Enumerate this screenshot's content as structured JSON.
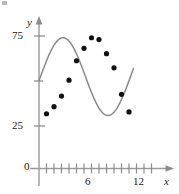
{
  "chart_data": {
    "type": "scatter",
    "title": "",
    "subtitle": "",
    "xlabel": "x",
    "ylabel": "y",
    "xlim": [
      0,
      13.2
    ],
    "ylim": [
      0,
      88
    ],
    "grid": false,
    "legend": null,
    "x_ticks_major": [
      6,
      12
    ],
    "x_tick_labels": [
      "6",
      "12"
    ],
    "x_ticks_minor": [
      1,
      2,
      3,
      4,
      5,
      7,
      8,
      9,
      10,
      11
    ],
    "y_ticks": [
      0,
      25,
      75
    ],
    "y_tick_labels": [
      "0",
      "25",
      "75"
    ],
    "point_color": "#111111",
    "curve_color": "#8a8a8a",
    "axis_color": "#9a9a9a",
    "scatter_points": [
      {
        "x": 1.0,
        "y": 31
      },
      {
        "x": 2.0,
        "y": 35
      },
      {
        "x": 3.0,
        "y": 41
      },
      {
        "x": 4.0,
        "y": 50
      },
      {
        "x": 5.0,
        "y": 61
      },
      {
        "x": 6.0,
        "y": 68
      },
      {
        "x": 7.0,
        "y": 74
      },
      {
        "x": 8.0,
        "y": 73
      },
      {
        "x": 9.0,
        "y": 65
      },
      {
        "x": 10.0,
        "y": 57
      },
      {
        "x": 11.0,
        "y": 42
      },
      {
        "x": 12.0,
        "y": 32
      }
    ],
    "fitted_curve": {
      "name": "sinusoidal model",
      "description": "smooth sine-like curve",
      "amplitude": 22,
      "midline": 52,
      "period": 12,
      "phase_peak_x": 3.2,
      "phase_trough_x": 9.3,
      "x_start": 0,
      "x_end": 12.6
    }
  },
  "labels": {
    "y_axis": "y",
    "x_axis": "x",
    "y_75": "75",
    "y_25": "25",
    "y_0": "0",
    "x_6": "6",
    "x_12": "12"
  }
}
